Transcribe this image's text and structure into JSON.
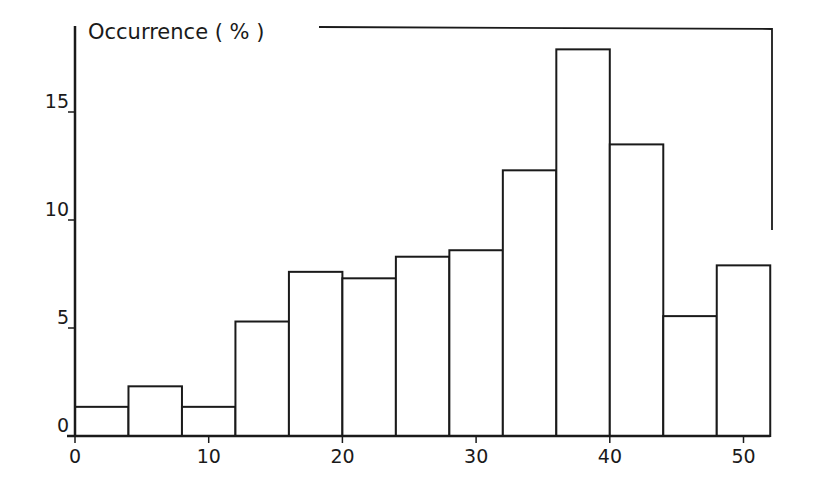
{
  "chart_data": {
    "type": "bar",
    "subtype": "histogram",
    "title": "",
    "ylabel": "Occurrence (%)",
    "xlabel": "",
    "bin_edges": [
      0,
      4,
      8,
      12,
      16,
      20,
      24,
      28,
      32,
      36,
      40,
      44,
      48,
      52
    ],
    "values": [
      1.35,
      2.3,
      1.35,
      5.3,
      7.6,
      7.3,
      8.3,
      8.6,
      12.3,
      17.9,
      13.5,
      5.55,
      7.9
    ],
    "xlim": [
      0,
      52
    ],
    "ylim": [
      0,
      18
    ],
    "x_ticks": [
      0,
      10,
      20,
      30,
      40,
      50
    ],
    "y_ticks": [
      0,
      5,
      10,
      15
    ],
    "x_tick_labels": [
      "0",
      "10",
      "20",
      "30",
      "40",
      "50"
    ],
    "y_tick_labels": [
      "0",
      "5",
      "10",
      "15"
    ],
    "grid": false,
    "legend": null,
    "bar_fill": "#ffffff",
    "bar_edge": "#1a1a1a",
    "bracket": {
      "description": "open frame line along top from x≈18 to right edge, then down right side to y≈9.5"
    }
  },
  "labels": {
    "ylabel": "Occurrence ( % )"
  }
}
